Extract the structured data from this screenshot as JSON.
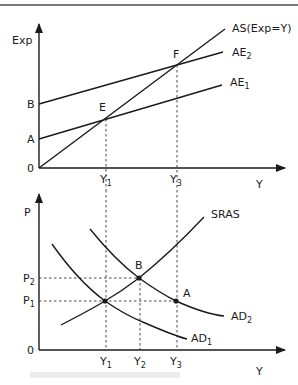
{
  "figure": {
    "top_panel": {
      "y_axis_label": "Exp",
      "x_axis_label": "Y",
      "origin_label": "0",
      "y_ticks": [
        {
          "main": "A",
          "sub": ""
        },
        {
          "main": "B",
          "sub": ""
        }
      ],
      "x_ticks": [
        {
          "main": "Y",
          "sub": "1"
        },
        {
          "main": "Y",
          "sub": "3"
        }
      ],
      "lines": [
        {
          "main": "AS(Exp=Y)",
          "sub": ""
        },
        {
          "main": "AE",
          "sub": "2"
        },
        {
          "main": "AE",
          "sub": "1"
        }
      ],
      "points": [
        {
          "label": "E"
        },
        {
          "label": "F"
        }
      ]
    },
    "bottom_panel": {
      "y_axis_label": "P",
      "x_axis_label": "Y",
      "origin_label": "0",
      "y_ticks": [
        {
          "main": "P",
          "sub": "2"
        },
        {
          "main": "P",
          "sub": "1"
        }
      ],
      "x_ticks": [
        {
          "main": "Y",
          "sub": "1"
        },
        {
          "main": "Y",
          "sub": "2"
        },
        {
          "main": "Y",
          "sub": "3"
        }
      ],
      "curves": [
        {
          "main": "SRAS",
          "sub": ""
        },
        {
          "main": "AD",
          "sub": "2"
        },
        {
          "main": "AD",
          "sub": "1"
        }
      ],
      "points": [
        {
          "label": "B"
        },
        {
          "label": "A"
        }
      ]
    }
  }
}
